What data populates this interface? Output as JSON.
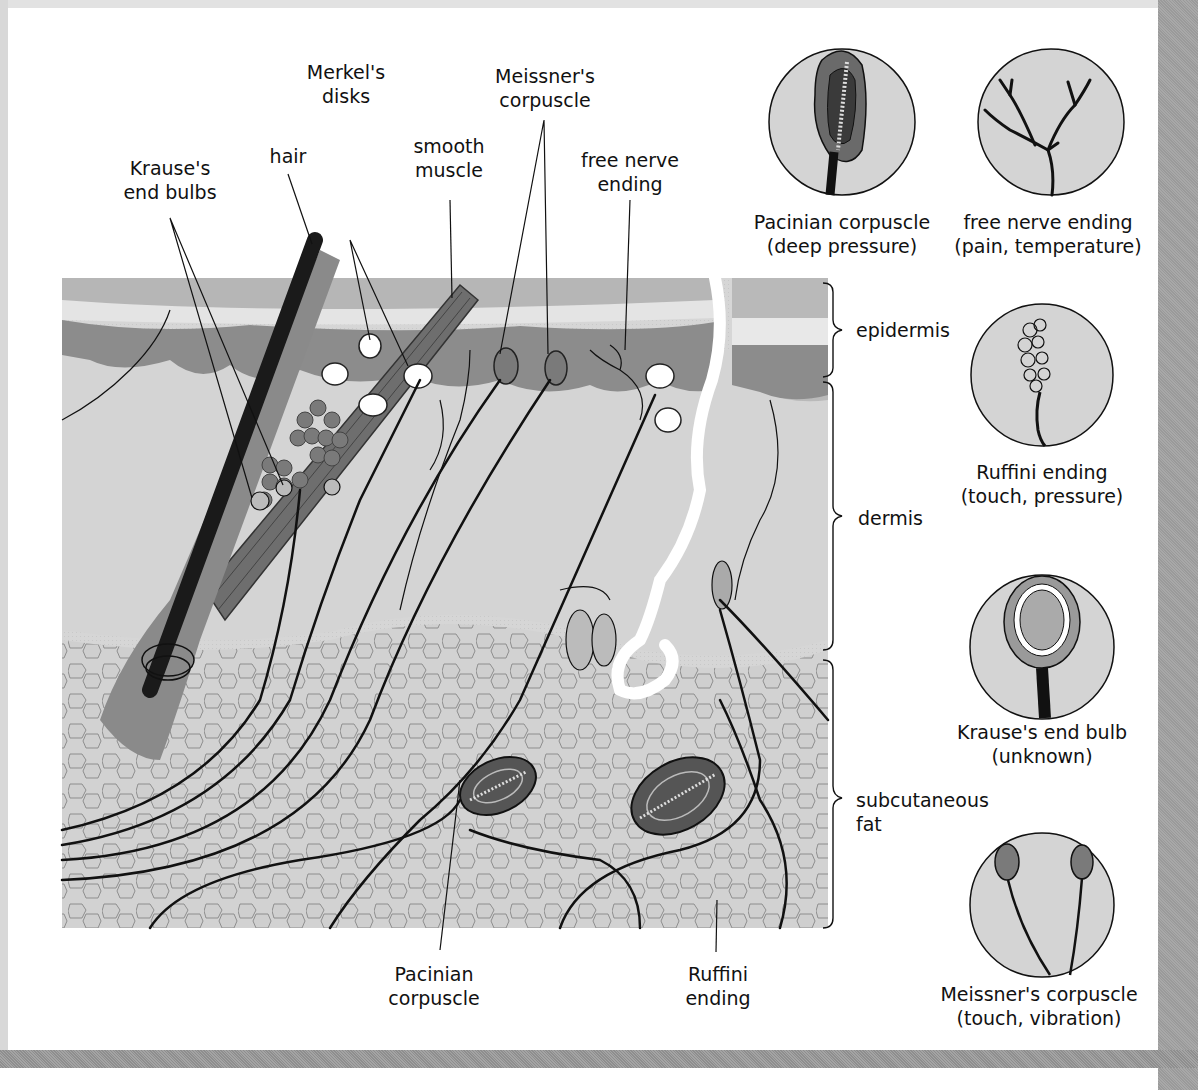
{
  "diagram": {
    "type": "anatomical cross-section",
    "colors": {
      "background": "#ffffff",
      "skin_fill": "#d2d2d2",
      "epidermis_top": "#b8b8b8",
      "epidermis_dark": "#8a8a8a",
      "nerve": "#111111",
      "hair": "#1a1a1a",
      "muscle": "#6e6e6e",
      "corpuscle_dark": "#555555",
      "frame": "#a0a0a0"
    }
  },
  "main_labels": {
    "krause": {
      "line1": "Krause's",
      "line2": "end bulbs"
    },
    "hair": {
      "line1": "hair"
    },
    "merkel": {
      "line1": "Merkel's",
      "line2": "disks"
    },
    "smooth_muscle": {
      "line1": "smooth",
      "line2": "muscle"
    },
    "meissner": {
      "line1": "Meissner's",
      "line2": "corpuscle"
    },
    "free_nerve": {
      "line1": "free nerve",
      "line2": "ending"
    },
    "pacinian_bottom": {
      "line1": "Pacinian",
      "line2": "corpuscle"
    },
    "ruffini_bottom": {
      "line1": "Ruffini",
      "line2": "ending"
    }
  },
  "layers": [
    {
      "name": "epidermis"
    },
    {
      "name": "dermis"
    },
    {
      "name": "subcutaneous",
      "line2": "fat"
    }
  ],
  "insets": [
    {
      "id": "pacinian",
      "title": "Pacinian corpuscle",
      "function": "(deep pressure)"
    },
    {
      "id": "free-nerve",
      "title": "free nerve ending",
      "function": "(pain, temperature)"
    },
    {
      "id": "ruffini",
      "title": "Ruffini ending",
      "function": "(touch, pressure)"
    },
    {
      "id": "krause",
      "title": "Krause's end bulb",
      "function": "(unknown)"
    },
    {
      "id": "meissner",
      "title": "Meissner's corpuscle",
      "function": "(touch, vibration)"
    }
  ]
}
